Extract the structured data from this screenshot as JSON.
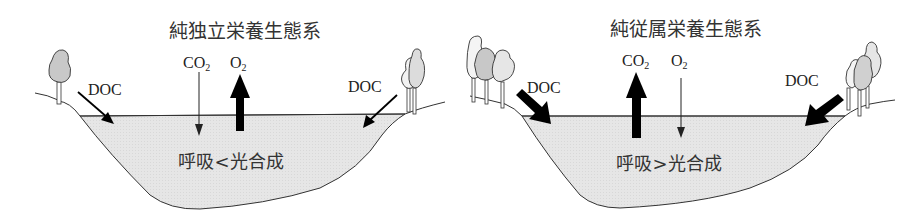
{
  "panels": [
    {
      "id": "autotrophic",
      "title": "純独立栄養生態系",
      "gas_labels": {
        "co2": "CO",
        "co2_sub": "2",
        "o2": "O",
        "o2_sub": "2"
      },
      "gas_flux": {
        "co2": "down-thin",
        "o2": "up-thick"
      },
      "doc_left": "DOC",
      "doc_right": "DOC",
      "doc_arrow_weight": "thin",
      "balance": "呼吸<光合成",
      "trees": {
        "left": 1,
        "right": 2
      }
    },
    {
      "id": "heterotrophic",
      "title": "純従属栄養生態系",
      "gas_labels": {
        "co2": "CO",
        "co2_sub": "2",
        "o2": "O",
        "o2_sub": "2"
      },
      "gas_flux": {
        "co2": "up-thick",
        "o2": "down-thin"
      },
      "doc_left": "DOC",
      "doc_right": "DOC",
      "doc_arrow_weight": "thick",
      "balance": "呼吸>光合成",
      "trees": {
        "left": 3,
        "right": 3
      }
    }
  ],
  "colors": {
    "water": "#e4e4e4",
    "outline": "#333333",
    "arrow": "#000000",
    "tree_fill_dark": "#c8c8c8",
    "tree_fill_light": "#e8e8e8",
    "text": "#333333"
  }
}
